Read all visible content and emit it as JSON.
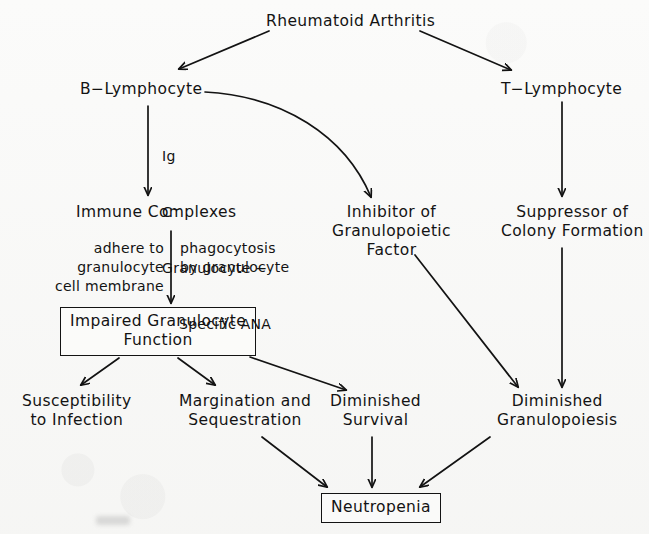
{
  "diagram": {
    "title": "Rheumatoid Arthritis",
    "type": "flowchart",
    "caption": "",
    "colors": {
      "ink": "#131313",
      "paper": "#fbfbfa"
    },
    "nodes": {
      "rheumatoid_arthritis": {
        "label": "Rheumatoid Arthritis",
        "boxed": false
      },
      "b_lymphocyte": {
        "label": "B−Lymphocyte",
        "boxed": false
      },
      "t_lymphocyte": {
        "label": "T−Lymphocyte",
        "boxed": false
      },
      "immune_complexes": {
        "label": "Immune Complexes",
        "boxed": false
      },
      "inhibitor_factor": {
        "label": "Inhibitor of\nGranulopoietic\nFactor",
        "boxed": false
      },
      "suppressor_colony": {
        "label": "Suppressor of\nColony Formation",
        "boxed": false
      },
      "impaired_granulocyte": {
        "label": "Impaired Granulocyte\nFunction",
        "boxed": true
      },
      "susceptibility": {
        "label": "Susceptibility\nto Infection",
        "boxed": false
      },
      "margination": {
        "label": "Margination and\nSequestration",
        "boxed": false
      },
      "diminished_survival": {
        "label": "Diminished\nSurvival",
        "boxed": false
      },
      "diminished_granulo": {
        "label": "Diminished\nGranulopoiesis",
        "boxed": false
      },
      "neutropenia": {
        "label": "Neutropenia",
        "boxed": true
      }
    },
    "annotations": {
      "mediators": {
        "line1": "Ig",
        "line2_base": "C",
        "line2_sup": "−",
        "line3": "Granulocyte −",
        "line4": "Specific ANA"
      },
      "adhere": "adhere to\ngranulocyte\ncell membrane",
      "phagocytosis": "phagocytosis\nby granulocyte"
    },
    "edges": [
      {
        "from": "rheumatoid_arthritis",
        "to": "b_lymphocyte",
        "style": "straight"
      },
      {
        "from": "rheumatoid_arthritis",
        "to": "t_lymphocyte",
        "style": "straight"
      },
      {
        "from": "b_lymphocyte",
        "to": "immune_complexes",
        "style": "straight"
      },
      {
        "from": "b_lymphocyte",
        "to": "inhibitor_factor",
        "style": "curved"
      },
      {
        "from": "t_lymphocyte",
        "to": "suppressor_colony",
        "style": "straight"
      },
      {
        "from": "immune_complexes",
        "to": "impaired_granulocyte",
        "style": "straight"
      },
      {
        "from": "impaired_granulocyte",
        "to": "susceptibility",
        "style": "straight"
      },
      {
        "from": "impaired_granulocyte",
        "to": "margination",
        "style": "straight"
      },
      {
        "from": "impaired_granulocyte",
        "to": "diminished_survival",
        "style": "straight"
      },
      {
        "from": "inhibitor_factor",
        "to": "diminished_granulo",
        "style": "straight"
      },
      {
        "from": "suppressor_colony",
        "to": "diminished_granulo",
        "style": "straight"
      },
      {
        "from": "margination",
        "to": "neutropenia",
        "style": "straight"
      },
      {
        "from": "diminished_survival",
        "to": "neutropenia",
        "style": "straight"
      },
      {
        "from": "diminished_granulo",
        "to": "neutropenia",
        "style": "straight"
      }
    ]
  }
}
